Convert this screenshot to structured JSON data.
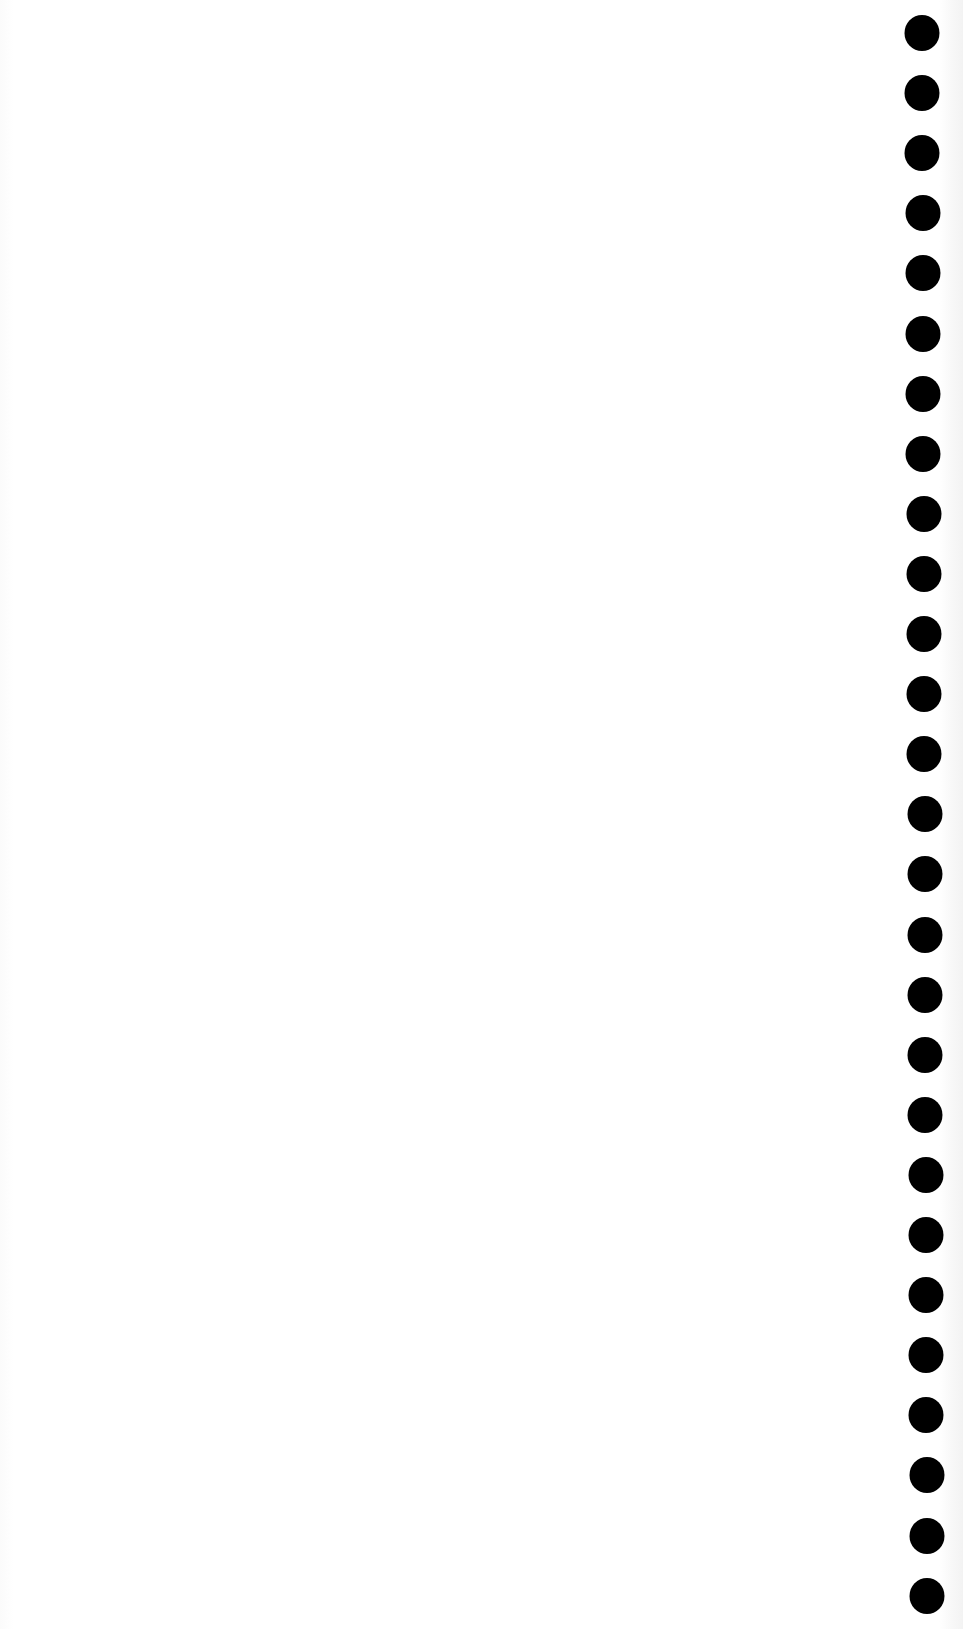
{
  "page": {
    "type": "scanned-blank-sheet",
    "background_color": "#ffffff",
    "edge_tint_color": "#f3f3f3",
    "visible_text": ""
  },
  "punch_holes": {
    "color": "#000000",
    "count": 27,
    "diameter_px": 35,
    "first_center_y": 33,
    "spacing_px": 60.1,
    "center_x_top": 922,
    "center_x_bottom": 927
  }
}
